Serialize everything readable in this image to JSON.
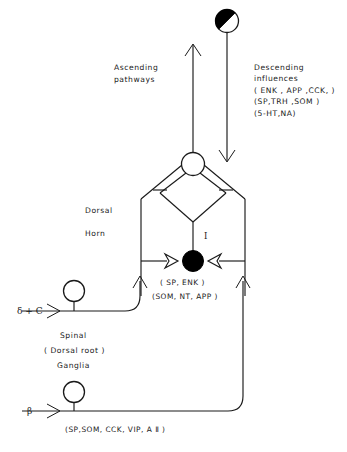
{
  "figure": {
    "type": "neuroanatomy-schematic",
    "title_visible": false,
    "background_color": "#ffffff",
    "ink_color": "#1a1a1a"
  },
  "labels": {
    "ascending": "Ascending\npathways",
    "ascending_line1": "Ascending",
    "ascending_line2": "pathways",
    "descending_line1": "Descending",
    "descending_line2": "influences",
    "descending_line3": "( ENK , APP ,CCK, )",
    "descending_line4": "(SP,TRH ,SOM )",
    "descending_line5": "(5-HT,NA)",
    "dorsal": "Dorsal",
    "horn": "Horn",
    "lamina_one": "I",
    "interneuron_transmitters_1": "( SP, ENK )",
    "interneuron_transmitters_2": "(SOM, NT, APP )",
    "fiber_delta_c": "δ + C",
    "ganglia_line1": "Spinal",
    "ganglia_line2": "( Dorsal  root )",
    "ganglia_line3": "Ganglia",
    "fiber_beta": "β",
    "beta_transmitters": "(SP,SOM, CCK, VIP, A Ⅱ )"
  },
  "elements": {
    "supraspinal_neuron": {
      "name": "half-filled-circle-neuron",
      "fill_style": "half-black-diagonal",
      "color_filled": "#000000",
      "color_open": "#ffffff"
    },
    "projection_neuron": {
      "name": "open-circle-neuron",
      "fill_style": "open",
      "color": "#ffffff"
    },
    "interneuron": {
      "name": "filled-circle-interneuron",
      "fill_style": "solid",
      "color": "#000000"
    },
    "drg_neuron_upper": {
      "name": "open-circle-neuron",
      "fill_style": "open"
    },
    "drg_neuron_lower": {
      "name": "open-circle-neuron",
      "fill_style": "open"
    },
    "arrows": {
      "ascending_direction": "up",
      "descending_direction": "down",
      "delta_c_direction": "right",
      "beta_direction": "right",
      "dorsal_horn_left_input_direction": "up",
      "dorsal_horn_right_input_direction": "up"
    }
  }
}
